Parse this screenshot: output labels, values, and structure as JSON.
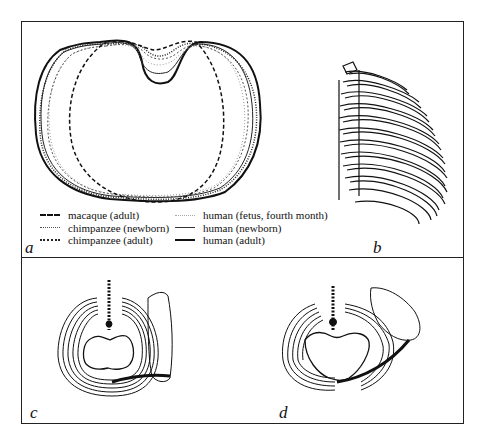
{
  "figure": {
    "panels": [
      {
        "id": "a",
        "label": "a",
        "description": "Superimposed cross-sectional thorax outlines"
      },
      {
        "id": "b",
        "label": "b",
        "description": "Lateral view of rib cage"
      },
      {
        "id": "c",
        "label": "c",
        "description": "Cranial view of thorax with scapula"
      },
      {
        "id": "d",
        "label": "d",
        "description": "Cranial view of thorax with scapula and clavicle"
      }
    ],
    "legend": {
      "left": [
        {
          "label": "macaque (adult)",
          "style": "dashed-bold"
        },
        {
          "label": "chimpanzee (newborn)",
          "style": "dotted-light"
        },
        {
          "label": "chimpanzee (adult)",
          "style": "dotted-bold"
        }
      ],
      "right": [
        {
          "label": "human (fetus, fourth month)",
          "style": "dotted-faint"
        },
        {
          "label": "human (newborn)",
          "style": "solid-thin"
        },
        {
          "label": "human (adult)",
          "style": "solid-bold"
        }
      ]
    }
  }
}
